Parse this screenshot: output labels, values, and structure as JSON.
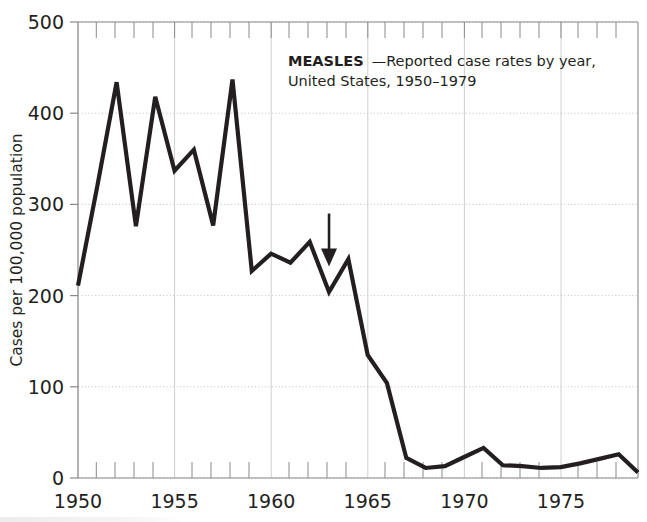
{
  "figure": {
    "title_bold": "MEASLES",
    "title_rest": "—Reported case rates by year,",
    "title_line2": "United States, 1950–1979",
    "annotation_label": "vaccine-licensure-arrow",
    "line_color": "#231f20",
    "grid_color": "#c8c8c8",
    "axis_color": "#808080",
    "background": "#ffffff"
  },
  "chart_data": {
    "type": "line",
    "xlabel": "",
    "ylabel": "Cases per 100,000 population",
    "xlim": [
      1950,
      1979
    ],
    "ylim": [
      0,
      500
    ],
    "grid": true,
    "legend": "none",
    "x_major_ticks": [
      1950,
      1955,
      1960,
      1965,
      1970,
      1975
    ],
    "x_major_tick_labels": [
      "1950",
      "1955",
      "1960",
      "1965",
      "1970",
      "1975"
    ],
    "x_minor_tick_step": 1,
    "y_ticks": [
      0,
      100,
      200,
      300,
      400,
      500
    ],
    "y_tick_labels": [
      "0",
      "100",
      "200",
      "300",
      "400",
      "500"
    ],
    "x": [
      1950,
      1951,
      1952,
      1953,
      1954,
      1955,
      1956,
      1957,
      1958,
      1959,
      1960,
      1961,
      1962,
      1963,
      1964,
      1965,
      1966,
      1967,
      1968,
      1969,
      1970,
      1971,
      1972,
      1973,
      1974,
      1975,
      1976,
      1977,
      1978,
      1979
    ],
    "values": [
      211,
      320,
      434,
      276,
      418,
      337,
      360,
      277,
      437,
      227,
      246,
      236,
      259,
      204,
      240,
      135,
      104,
      22,
      11,
      13,
      23,
      33,
      14,
      13,
      11,
      12,
      16,
      21,
      26,
      6
    ],
    "series": [
      {
        "name": "Reported measles case rate per 100,000",
        "values": [
          211,
          320,
          434,
          276,
          418,
          337,
          360,
          277,
          437,
          227,
          246,
          236,
          259,
          204,
          240,
          135,
          104,
          22,
          11,
          13,
          23,
          33,
          14,
          13,
          11,
          12,
          16,
          21,
          26,
          6
        ]
      }
    ],
    "annotations": [
      {
        "type": "arrow",
        "x": 1963,
        "y_from": 290,
        "y_to": 232,
        "direction": "down"
      }
    ]
  }
}
